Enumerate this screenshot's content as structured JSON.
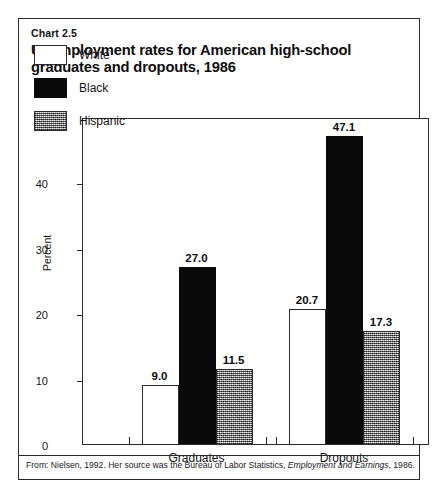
{
  "header": {
    "chart_number": "Chart 2.5",
    "title": "Unemployment rates for American high-school graduates and dropouts, 1986"
  },
  "legend": {
    "items": [
      {
        "label": "White",
        "swatch": "white-swatch",
        "color": "#ffffff"
      },
      {
        "label": "Black",
        "swatch": "black-swatch",
        "color": "#0a0a0a"
      },
      {
        "label": "Hispanic",
        "swatch": "hispanic-stipple-swatch",
        "color": "#9a9a9a"
      }
    ]
  },
  "footer": {
    "source_prefix": "From: Nielsen, 1992. Her source was the Bureau of Labor Statistics, ",
    "source_italic": "Employment and Earnings",
    "source_suffix": ", 1986."
  },
  "chart_data": {
    "type": "bar",
    "title": "Unemployment rates for American high-school graduates and dropouts, 1986",
    "xlabel": "",
    "ylabel": "Percent",
    "categories": [
      "Graduates",
      "Dropouts"
    ],
    "series": [
      {
        "name": "White",
        "values": [
          9.0,
          20.7
        ],
        "labels": [
          "9.0",
          "20.7"
        ]
      },
      {
        "name": "Black",
        "values": [
          27.0,
          47.1
        ],
        "labels": [
          "27.0",
          "47.1"
        ]
      },
      {
        "name": "Hispanic",
        "values": [
          11.5,
          17.3
        ],
        "labels": [
          "11.5",
          "17.3"
        ]
      }
    ],
    "ylim": [
      0,
      50
    ],
    "yticks": [
      0,
      10,
      20,
      30,
      40,
      50
    ],
    "ytick_labels": [
      "0",
      "10",
      "20",
      "30",
      "40",
      "50"
    ],
    "grid": false,
    "legend_position": "upper-left-inside",
    "bars_grouped_adjacent": true
  }
}
